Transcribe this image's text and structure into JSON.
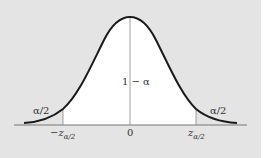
{
  "diagram": {
    "type": "normal-distribution-two-tailed",
    "center_label": "1 − α",
    "left_tail_label": "α/2",
    "right_tail_label": "α/2",
    "axis_labels": {
      "left": {
        "prefix": "−",
        "var": "z",
        "sub": "α/2"
      },
      "center": "0",
      "right": {
        "prefix": "",
        "var": "z",
        "sub": "α/2"
      }
    },
    "colors": {
      "background": "#e4e4e4",
      "center_region": "#ffffff",
      "curve": "#1a1a1a",
      "axis": "#666666"
    }
  }
}
